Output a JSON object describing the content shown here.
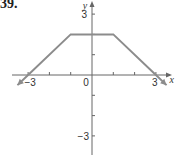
{
  "problem_number": "39.",
  "chart_data": {
    "type": "line",
    "title": "",
    "xlabel": "x",
    "ylabel": "y",
    "x": [
      -3.5,
      -3,
      -1,
      1,
      3,
      3.5
    ],
    "series": [
      {
        "name": "f",
        "x": [
          -3.5,
          -3,
          -1,
          1,
          3,
          3.5
        ],
        "values": [
          -0.5,
          0,
          2,
          2,
          0,
          -0.5
        ],
        "color": "#8c8c8c"
      }
    ],
    "xlim": [
      -3.4,
      3.8
    ],
    "ylim": [
      -3.6,
      3.6
    ],
    "x_tick_labels": [
      "-3",
      "0",
      "3"
    ],
    "y_tick_labels": [
      "3",
      "-3"
    ],
    "x_ticks": [
      -3,
      -2,
      -1,
      1,
      2,
      3
    ],
    "y_ticks": [
      -3,
      -2,
      -1,
      1,
      2,
      3
    ],
    "grid": false,
    "legend": "none",
    "annotations": [
      "arrows on both ends of the graph"
    ]
  },
  "colors": {
    "axis": "#666666",
    "graph": "#8c8c8c"
  }
}
